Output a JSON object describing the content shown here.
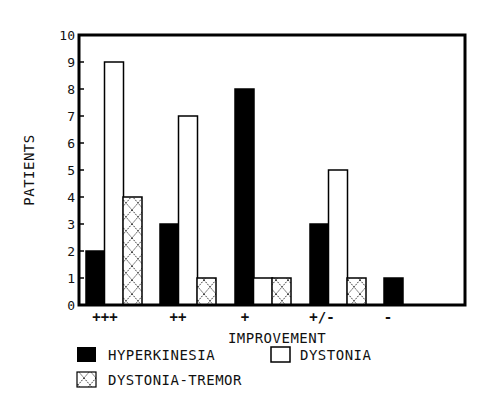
{
  "chart_data": {
    "type": "bar",
    "title": "",
    "xlabel": "IMPROVEMENT",
    "ylabel": "PATIENTS",
    "ylim": [
      0,
      10
    ],
    "yticks": [
      0,
      1,
      2,
      3,
      4,
      5,
      6,
      7,
      8,
      9,
      10
    ],
    "grid": false,
    "legend_position": "bottom",
    "categories": [
      "+++",
      "++",
      "+",
      "+/-",
      "-"
    ],
    "series": [
      {
        "name": "HYPERKINESIA",
        "fill": "solid-black",
        "values": [
          2,
          3,
          8,
          3,
          1
        ]
      },
      {
        "name": "DYSTONIA",
        "fill": "white-outline",
        "values": [
          9,
          7,
          1,
          5,
          0
        ]
      },
      {
        "name": "DYSTONIA-TREMOR",
        "fill": "crosshatch",
        "values": [
          4,
          1,
          1,
          1,
          0
        ]
      }
    ]
  },
  "colors": {
    "ink": "#000000",
    "background": "#ffffff"
  },
  "legend": {
    "items": [
      {
        "label": "HYPERKINESIA",
        "swatch": "solid-black"
      },
      {
        "label": "DYSTONIA",
        "swatch": "white-outline"
      },
      {
        "label": "DYSTONIA-TREMOR",
        "swatch": "crosshatch"
      }
    ]
  }
}
